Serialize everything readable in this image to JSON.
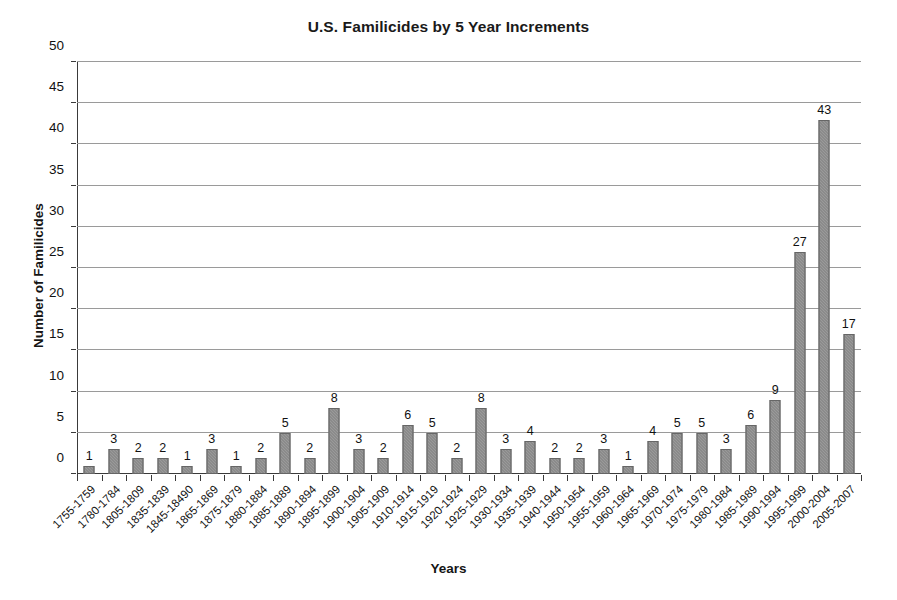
{
  "chart_data": {
    "type": "bar",
    "title": "U.S. Familicides by 5 Year Increments",
    "xlabel": "Years",
    "ylabel": "Number of Familicides",
    "ylim": [
      0,
      50
    ],
    "ytick_step": 5,
    "yticks": [
      0,
      5,
      10,
      15,
      20,
      25,
      30,
      35,
      40,
      45,
      50
    ],
    "grid": true,
    "legend": "none",
    "bar_color": "#7d7d7d",
    "show_value_labels": true,
    "categories": [
      "1755-1759",
      "1780-1784",
      "1805-1809",
      "1835-1839",
      "1845-18490",
      "1865-1869",
      "1875-1879",
      "1880-1884",
      "1885-1889",
      "1890-1894",
      "1895-1899",
      "1900-1904",
      "1905-1909",
      "1910-1914",
      "1915-1919",
      "1920-1924",
      "1925-1929",
      "1930-1934",
      "1935-1939",
      "1940-1944",
      "1950-1954",
      "1955-1959",
      "1960-1964",
      "1965-1969",
      "1970-1974",
      "1975-1979",
      "1980-1984",
      "1985-1989",
      "1990-1994",
      "1995-1999",
      "2000-2004",
      "2005-2007"
    ],
    "values": [
      1,
      3,
      2,
      2,
      1,
      3,
      1,
      2,
      5,
      2,
      8,
      3,
      2,
      6,
      5,
      2,
      8,
      3,
      4,
      2,
      2,
      3,
      1,
      4,
      5,
      5,
      3,
      6,
      9,
      27,
      43,
      17
    ]
  }
}
